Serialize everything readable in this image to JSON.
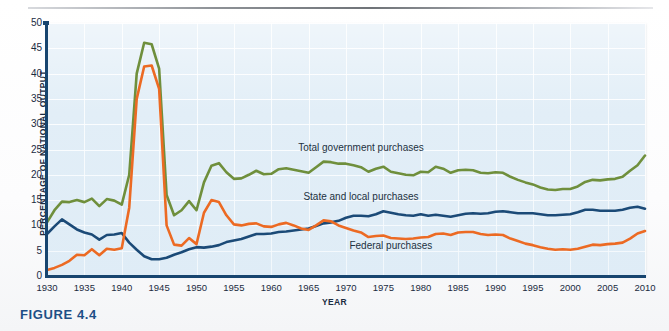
{
  "figure": {
    "caption": "FIGURE 4.4"
  },
  "chart_data": {
    "type": "line",
    "title": "",
    "xlabel": "YEAR",
    "ylabel": "PERCENTAGE OF NATIONAL OUTPUT",
    "xlim": [
      1930,
      2010
    ],
    "ylim": [
      0,
      50
    ],
    "grid": true,
    "legend_position": "inline-annotations",
    "xticks": [
      1930,
      1935,
      1940,
      1945,
      1950,
      1955,
      1960,
      1965,
      1970,
      1975,
      1980,
      1985,
      1990,
      1995,
      2000,
      2005,
      2010
    ],
    "yticks": [
      0,
      5,
      10,
      15,
      20,
      25,
      30,
      35,
      40,
      45,
      50
    ],
    "x": [
      1930,
      1931,
      1932,
      1933,
      1934,
      1935,
      1936,
      1937,
      1938,
      1939,
      1940,
      1941,
      1942,
      1943,
      1944,
      1945,
      1946,
      1947,
      1948,
      1949,
      1950,
      1951,
      1952,
      1953,
      1954,
      1955,
      1956,
      1957,
      1958,
      1959,
      1960,
      1961,
      1962,
      1963,
      1964,
      1965,
      1966,
      1967,
      1968,
      1969,
      1970,
      1971,
      1972,
      1973,
      1974,
      1975,
      1976,
      1977,
      1978,
      1979,
      1980,
      1981,
      1982,
      1983,
      1984,
      1985,
      1986,
      1987,
      1988,
      1989,
      1990,
      1991,
      1992,
      1993,
      1994,
      1995,
      1996,
      1997,
      1998,
      1999,
      2000,
      2001,
      2002,
      2003,
      2004,
      2005,
      2006,
      2007,
      2008,
      2009,
      2010
    ],
    "series": [
      {
        "name": "Total government purchases",
        "color": "#6f8f3c",
        "label_x": 1972,
        "label_y": 25.2,
        "values": [
          10.6,
          13.0,
          14.7,
          14.6,
          15.0,
          14.6,
          15.3,
          13.8,
          15.2,
          14.9,
          14.1,
          20.0,
          40.0,
          46.1,
          45.8,
          41.0,
          16.0,
          12.0,
          13.0,
          14.8,
          13.0,
          18.5,
          21.8,
          22.3,
          20.5,
          19.2,
          19.3,
          20.0,
          20.8,
          20.1,
          20.2,
          21.1,
          21.3,
          21.0,
          20.7,
          20.4,
          21.5,
          22.6,
          22.5,
          22.2,
          22.2,
          21.9,
          21.5,
          20.6,
          21.2,
          21.6,
          20.6,
          20.3,
          20.0,
          19.9,
          20.6,
          20.5,
          21.6,
          21.2,
          20.4,
          20.9,
          21.0,
          20.9,
          20.4,
          20.3,
          20.5,
          20.4,
          19.6,
          19.0,
          18.5,
          18.1,
          17.5,
          17.1,
          17.0,
          17.2,
          17.2,
          17.7,
          18.6,
          19.0,
          18.9,
          19.1,
          19.2,
          19.6,
          20.8,
          21.9,
          23.8
        ]
      },
      {
        "name": "State and local purchases",
        "color": "#1b4a77",
        "label_x": 1972,
        "label_y": 15.6,
        "values": [
          8.3,
          9.8,
          11.2,
          10.2,
          9.2,
          8.6,
          8.2,
          7.2,
          8.1,
          8.2,
          8.5,
          6.6,
          5.2,
          3.9,
          3.3,
          3.3,
          3.6,
          4.2,
          4.7,
          5.3,
          5.7,
          5.6,
          5.8,
          6.1,
          6.7,
          7.0,
          7.3,
          7.8,
          8.3,
          8.3,
          8.4,
          8.7,
          8.8,
          9.0,
          9.2,
          9.4,
          9.9,
          10.4,
          10.6,
          10.9,
          11.5,
          11.9,
          11.9,
          11.8,
          12.2,
          12.8,
          12.5,
          12.2,
          12.0,
          11.9,
          12.2,
          11.9,
          12.1,
          11.9,
          11.7,
          12.0,
          12.3,
          12.4,
          12.3,
          12.4,
          12.7,
          12.8,
          12.6,
          12.4,
          12.4,
          12.4,
          12.2,
          12.0,
          12.0,
          12.1,
          12.2,
          12.6,
          13.1,
          13.1,
          12.9,
          12.9,
          12.9,
          13.1,
          13.5,
          13.7,
          13.3
        ]
      },
      {
        "name": "Federal purchases",
        "color": "#ec6a23",
        "label_x": 1976,
        "label_y": 6.0,
        "values": [
          1.2,
          1.6,
          2.2,
          3.0,
          4.2,
          4.1,
          5.3,
          4.1,
          5.4,
          5.2,
          5.5,
          13.5,
          35.0,
          41.4,
          41.6,
          37.0,
          10.0,
          6.2,
          6.0,
          7.5,
          6.3,
          12.5,
          15.0,
          14.6,
          12.0,
          10.2,
          10.0,
          10.3,
          10.4,
          9.8,
          9.7,
          10.2,
          10.5,
          10.0,
          9.4,
          9.1,
          10.0,
          11.0,
          10.8,
          10.0,
          9.5,
          9.0,
          8.6,
          7.7,
          7.9,
          8.0,
          7.5,
          7.4,
          7.3,
          7.4,
          7.6,
          7.7,
          8.3,
          8.4,
          8.1,
          8.6,
          8.7,
          8.7,
          8.3,
          8.1,
          8.2,
          8.1,
          7.4,
          6.9,
          6.4,
          6.1,
          5.7,
          5.4,
          5.2,
          5.3,
          5.2,
          5.4,
          5.8,
          6.2,
          6.1,
          6.3,
          6.4,
          6.6,
          7.4,
          8.4,
          8.9
        ]
      }
    ]
  }
}
